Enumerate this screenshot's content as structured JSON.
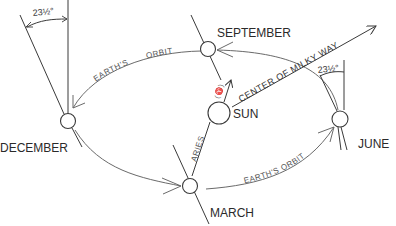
{
  "diagram": {
    "labels": {
      "september": "SEPTEMBER",
      "december": "DECEMBER",
      "march": "MARCH",
      "june": "JUNE",
      "sun": "SUN",
      "aries": "ARIES",
      "aries_symbol": "(♈)",
      "orbit_top_1": "EARTH'S",
      "orbit_top_2": "ORBIT",
      "orbit_bottom": "EARTH'S ORBIT",
      "milky_way": "CENTER OF MILKY WAY",
      "tilt_left": "23½°",
      "tilt_right": "23½°"
    },
    "nodes": [
      {
        "id": "september",
        "x": 208,
        "y": 49
      },
      {
        "id": "december",
        "x": 68,
        "y": 121
      },
      {
        "id": "march",
        "x": 190,
        "y": 186
      },
      {
        "id": "june",
        "x": 340,
        "y": 119
      },
      {
        "id": "sun",
        "x": 219,
        "y": 113
      }
    ],
    "colors": {
      "line": "#3a3a3a",
      "orbit": "#6a6a6a",
      "text": "#2a2a2a",
      "background": "#ffffff"
    }
  }
}
